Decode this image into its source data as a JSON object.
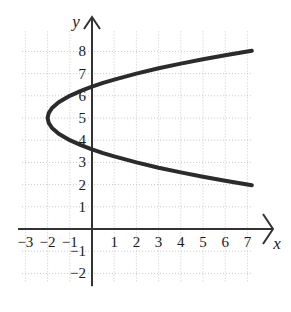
{
  "chart_data": {
    "type": "line",
    "title": "",
    "xlabel": "x",
    "ylabel": "y",
    "xlim": [
      -3.15,
      7.2
    ],
    "ylim": [
      -2.4,
      8.9
    ],
    "grid": true,
    "grid_step": 1,
    "legend": null,
    "x_ticks": [
      -3,
      -2,
      -1,
      1,
      2,
      3,
      4,
      5,
      6,
      7
    ],
    "y_ticks": [
      -2,
      -1,
      1,
      2,
      3,
      4,
      5,
      6,
      7,
      8
    ],
    "x_tick_labels": [
      "−3",
      "−2",
      "−1",
      "1",
      "2",
      "3",
      "4",
      "5",
      "6",
      "7"
    ],
    "y_tick_labels": [
      "−2",
      "−1",
      "1",
      "2",
      "3",
      "4",
      "5",
      "6",
      "7",
      "8"
    ],
    "annotations": [],
    "series": [
      {
        "name": "parabola",
        "equation": "x = (y - 5)^2 - 2",
        "orientation": "horizontal-opens-right",
        "vertex": [
          -2,
          5
        ],
        "color": "#2b2b2b",
        "linewidth": 4,
        "points": [
          [
            7.2,
            8.03
          ],
          [
            6.0,
            7.83
          ],
          [
            5.0,
            7.65
          ],
          [
            4.0,
            7.45
          ],
          [
            3.0,
            7.24
          ],
          [
            2.0,
            7.0
          ],
          [
            1.0,
            6.73
          ],
          [
            0.5,
            6.58
          ],
          [
            0.0,
            6.41
          ],
          [
            -0.5,
            6.22
          ],
          [
            -1.0,
            6.0
          ],
          [
            -1.5,
            5.71
          ],
          [
            -1.8,
            5.45
          ],
          [
            -1.95,
            5.22
          ],
          [
            -2.0,
            5.0
          ],
          [
            -1.95,
            4.78
          ],
          [
            -1.8,
            4.55
          ],
          [
            -1.5,
            4.29
          ],
          [
            -1.0,
            4.0
          ],
          [
            -0.5,
            3.78
          ],
          [
            0.0,
            3.59
          ],
          [
            0.5,
            3.42
          ],
          [
            1.0,
            3.27
          ],
          [
            2.0,
            3.0
          ],
          [
            3.0,
            2.76
          ],
          [
            4.0,
            2.55
          ],
          [
            5.0,
            2.35
          ],
          [
            6.0,
            2.17
          ],
          [
            7.2,
            1.97
          ]
        ]
      }
    ]
  },
  "axes": {
    "x_label": "x",
    "y_label": "y",
    "x_arrow": "arrow-right-icon",
    "y_arrow": "arrow-up-icon",
    "axis_color": "#333333",
    "grid_color": "#c8c8c8"
  }
}
